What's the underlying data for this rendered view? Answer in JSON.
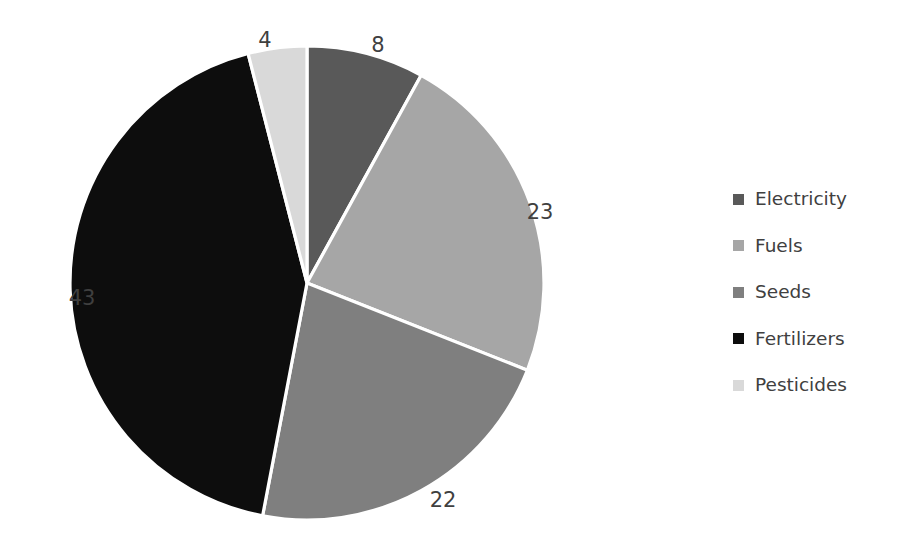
{
  "chart_data": {
    "type": "pie",
    "title": "",
    "categories": [
      "Electricity",
      "Fuels",
      "Seeds",
      "Fertilizers",
      "Pesticides"
    ],
    "values": [
      8,
      23,
      22,
      43,
      4
    ],
    "total": 100,
    "data_labels": [
      "8",
      "23",
      "22",
      "43",
      "4"
    ],
    "colors": [
      "#595959",
      "#a6a6a6",
      "#7f7f7f",
      "#0d0d0d",
      "#d9d9d9"
    ],
    "slice_border_color": "#ffffff",
    "start_angle_deg": 0,
    "direction": "clockwise",
    "legend": {
      "position": "right",
      "entries": [
        {
          "label": "Electricity",
          "color": "#595959"
        },
        {
          "label": "Fuels",
          "color": "#a6a6a6"
        },
        {
          "label": "Seeds",
          "color": "#7f7f7f"
        },
        {
          "label": "Fertilizers",
          "color": "#0d0d0d"
        },
        {
          "label": "Pesticides",
          "color": "#d9d9d9"
        }
      ]
    },
    "label_positions": [
      {
        "text": "8",
        "x": 378,
        "y": 45
      },
      {
        "text": "23",
        "x": 540,
        "y": 212
      },
      {
        "text": "22",
        "x": 443,
        "y": 500
      },
      {
        "text": "43",
        "x": 82,
        "y": 298
      },
      {
        "text": "4",
        "x": 265,
        "y": 40
      }
    ],
    "geometry": {
      "cx": 307,
      "cy": 283,
      "r": 237
    },
    "background": "#ffffff"
  }
}
